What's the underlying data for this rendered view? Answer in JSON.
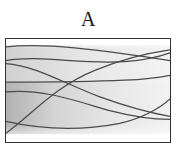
{
  "panel": {
    "label": "A"
  },
  "colors": {
    "background": "#ffffff",
    "frame_border": "#333333",
    "curve_stroke": "#4a4a4a",
    "band_light": "#f2f2f2",
    "band_mid": "#e2e2e2",
    "band_dark": "#c6c6c6",
    "band_darkest": "#b4b4b4"
  },
  "chart_data": {
    "type": "line",
    "title": "A",
    "xlabel": "",
    "ylabel": "",
    "xlim": [
      0,
      166
    ],
    "ylim": [
      0,
      105
    ],
    "grid": false,
    "legend": null,
    "axes_visible": false,
    "background_bands": [
      {
        "name": "upper-white-strip",
        "y_range": [
          0,
          6
        ],
        "fill": "#ffffff"
      },
      {
        "name": "upper-grey-band",
        "y_range": [
          6,
          44
        ],
        "fill_left": "#d2d2d2",
        "fill_right": "#f0f0f0"
      },
      {
        "name": "lower-grey-band",
        "y_range": [
          44,
          97
        ],
        "fill_left": "#b4b4b4",
        "fill_right": "#efefef"
      },
      {
        "name": "bottom-white-strip",
        "y_range": [
          97,
          105
        ],
        "fill": "#ffffff"
      }
    ],
    "series": [
      {
        "name": "curve-1",
        "stroke": "#4a4a4a",
        "path": "M 0,8 C 40,4 90,10 166,22",
        "points": [
          [
            0,
            8
          ],
          [
            55,
            6
          ],
          [
            110,
            13
          ],
          [
            166,
            22
          ]
        ]
      },
      {
        "name": "curve-2",
        "stroke": "#4a4a4a",
        "path": "M 0,22 C 35,16 75,26 120,23 C 145,21 158,17 166,14",
        "points": [
          [
            0,
            22
          ],
          [
            40,
            18
          ],
          [
            80,
            26
          ],
          [
            120,
            23
          ],
          [
            166,
            14
          ]
        ]
      },
      {
        "name": "curve-3",
        "stroke": "#4a4a4a",
        "path": "M 0,25 C 30,27 60,46 95,59 C 125,70 150,76 166,79",
        "points": [
          [
            0,
            25
          ],
          [
            40,
            33
          ],
          [
            80,
            52
          ],
          [
            120,
            68
          ],
          [
            166,
            79
          ]
        ]
      },
      {
        "name": "curve-4",
        "stroke": "#4a4a4a",
        "path": "M 0,44 C 40,44 80,44 120,42 C 142,41 156,39 166,37",
        "points": [
          [
            0,
            44
          ],
          [
            40,
            44
          ],
          [
            80,
            44
          ],
          [
            120,
            42
          ],
          [
            166,
            37
          ]
        ]
      },
      {
        "name": "curve-5",
        "stroke": "#4a4a4a",
        "path": "M 0,54 C 35,50 70,63 105,73 C 132,80 152,82 166,82",
        "points": [
          [
            0,
            54
          ],
          [
            40,
            52
          ],
          [
            80,
            65
          ],
          [
            120,
            78
          ],
          [
            166,
            82
          ]
        ]
      },
      {
        "name": "curve-6",
        "stroke": "#4a4a4a",
        "path": "M 0,96 C 25,78 50,48 90,32 C 118,20 145,14 166,11",
        "points": [
          [
            0,
            96
          ],
          [
            30,
            70
          ],
          [
            70,
            40
          ],
          [
            110,
            21
          ],
          [
            166,
            11
          ]
        ]
      },
      {
        "name": "curve-7",
        "stroke": "#4a4a4a",
        "path": "M 0,84 C 35,92 75,94 115,86 C 140,80 156,70 166,61",
        "points": [
          [
            0,
            84
          ],
          [
            40,
            92
          ],
          [
            80,
            93
          ],
          [
            120,
            84
          ],
          [
            166,
            61
          ]
        ]
      }
    ]
  }
}
